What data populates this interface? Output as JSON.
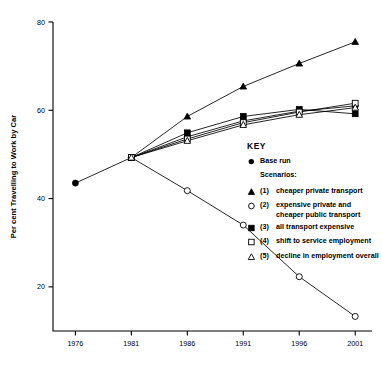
{
  "chart_data": {
    "type": "line",
    "title": "",
    "xlabel": "",
    "ylabel": "Per cent Travelling to Work by Car",
    "x": [
      1976,
      1981,
      1986,
      1991,
      1996,
      2001
    ],
    "xticklabels": [
      "1976",
      "1981",
      "1986",
      "1991",
      "1996",
      "2001"
    ],
    "yticklabels": [
      "20",
      "40",
      "60",
      "80"
    ],
    "yticks": [
      20,
      40,
      60,
      80
    ],
    "ylim": [
      10,
      80
    ],
    "xlim": [
      1974,
      2002.5
    ],
    "grid": false,
    "legend_position": "inside-right",
    "series": [
      {
        "name": "Base run",
        "marker": "filled-circle",
        "x": [
          1976,
          1981,
          1986,
          1991,
          1996,
          2001
        ],
        "values": [
          43.5,
          49.3,
          54.0,
          57.6,
          59.8,
          61.0
        ]
      },
      {
        "name": "(1) cheaper private transport",
        "marker": "filled-triangle",
        "x": [
          1981,
          1986,
          1991,
          1996,
          2001
        ],
        "values": [
          49.3,
          58.6,
          65.4,
          70.6,
          75.5
        ]
      },
      {
        "name": "(2) expensive private and cheaper public transport",
        "marker": "open-circle",
        "x": [
          1981,
          1986,
          1991,
          1996,
          2001
        ],
        "values": [
          49.3,
          41.8,
          34.0,
          22.3,
          13.3
        ]
      },
      {
        "name": "(3) all transport expensive",
        "marker": "filled-square",
        "x": [
          1981,
          1986,
          1991,
          1996,
          2001
        ],
        "values": [
          49.3,
          54.9,
          58.6,
          60.2,
          59.2
        ]
      },
      {
        "name": "(4) shift to service employment",
        "marker": "open-square",
        "x": [
          1981,
          1986,
          1991,
          1996,
          2001
        ],
        "values": [
          49.3,
          53.5,
          57.2,
          59.6,
          61.6
        ]
      },
      {
        "name": "(5) decline in employment overall",
        "marker": "open-triangle",
        "x": [
          1981,
          1986,
          1991,
          1996,
          2001
        ],
        "values": [
          49.3,
          53.1,
          56.7,
          59.0,
          60.6
        ]
      }
    ]
  },
  "key": {
    "title": "KEY",
    "base_run_label": "Base run",
    "scenarios_label": "Scenarios:",
    "entries": [
      {
        "num": "(1)",
        "marker": "filled-triangle",
        "text": "cheaper private transport"
      },
      {
        "num": "(2)",
        "marker": "open-circle",
        "text": "expensive private and cheaper public transport"
      },
      {
        "num": "(3)",
        "marker": "filled-square",
        "text": "all transport expensive"
      },
      {
        "num": "(4)",
        "marker": "open-square",
        "text": "shift to service employment"
      },
      {
        "num": "(5)",
        "marker": "open-triangle",
        "text": "decline in employment overall"
      }
    ]
  }
}
